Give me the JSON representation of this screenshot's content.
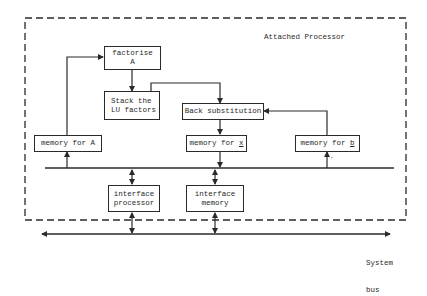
{
  "title": "Attached Processor",
  "blocks": {
    "factorise": {
      "line1": "factorise",
      "line2": "A"
    },
    "stack": {
      "line1": "Stack the",
      "line2": "LU factors"
    },
    "back_sub": {
      "label": "Back substitution"
    },
    "mem_a": {
      "label": "memory for A"
    },
    "mem_x": {
      "prefix": "memory for ",
      "var": "x"
    },
    "mem_b": {
      "prefix": "memory for ",
      "var": "b"
    },
    "iface_proc": {
      "line1": "interface",
      "line2": "processor"
    },
    "iface_mem": {
      "line1": "interface",
      "line2": "memory"
    }
  },
  "system_bus": {
    "line1": "System",
    "line2": "bus"
  },
  "mem_b_arrow_mark": "’",
  "colors": {
    "stroke": "#2a2a2a",
    "background": "#ffffff"
  }
}
